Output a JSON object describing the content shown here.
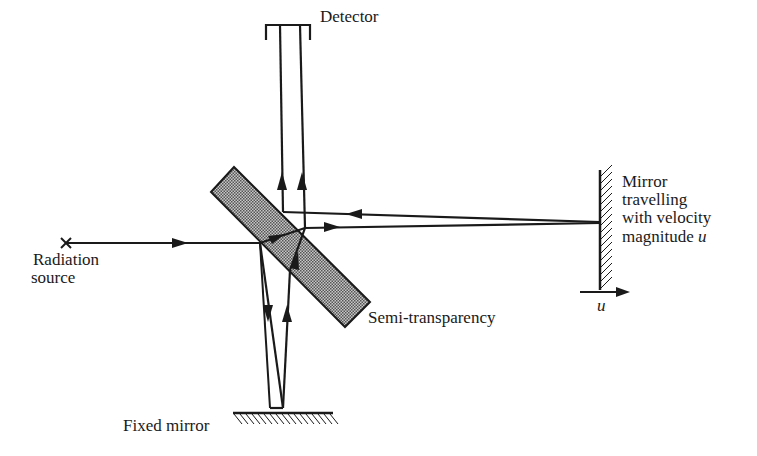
{
  "diagram": {
    "colors": {
      "ink": "#1a1a1a",
      "slab_fill": "#9a9a9a",
      "background": "#ffffff"
    },
    "labels": {
      "detector": "Detector",
      "radiation_source_line1": "Radiation",
      "radiation_source_line2": "source",
      "semi_transparency": "Semi-transparency",
      "fixed_mirror": "Fixed mirror",
      "moving_mirror_line1": "Mirror",
      "moving_mirror_line2": "travelling",
      "moving_mirror_line3": "with velocity",
      "moving_mirror_line4": "magnitude ",
      "velocity_symbol": "u",
      "velocity_arrow_symbol": "u"
    },
    "source_marker": "×"
  }
}
